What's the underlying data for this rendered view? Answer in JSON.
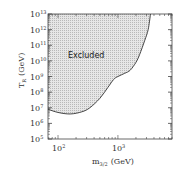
{
  "chart_data": {
    "type": "area",
    "title": "",
    "xlabel": "m_{3/2} (GeV)",
    "ylabel": "T_R (GeV)",
    "xscale": "log",
    "yscale": "log",
    "xlim": [
      68,
      8000
    ],
    "ylim": [
      100000.0,
      10000000000000.0
    ],
    "x_ticks": [
      {
        "value": 100,
        "label": "10",
        "exp": "2"
      },
      {
        "value": 1000,
        "label": "10",
        "exp": "3"
      }
    ],
    "y_ticks": [
      {
        "value": 10000000000000.0,
        "label": "10",
        "exp": "13"
      },
      {
        "value": 1000000000000.0,
        "label": "10",
        "exp": "12"
      },
      {
        "value": 100000000000.0,
        "label": "10",
        "exp": "11"
      },
      {
        "value": 10000000000.0,
        "label": "10",
        "exp": "10"
      },
      {
        "value": 1000000000.0,
        "label": "10",
        "exp": "9"
      },
      {
        "value": 100000000.0,
        "label": "10",
        "exp": "8"
      },
      {
        "value": 10000000.0,
        "label": "10",
        "exp": "7"
      },
      {
        "value": 1000000.0,
        "label": "10",
        "exp": "6"
      },
      {
        "value": 100000.0,
        "label": "10",
        "exp": "5"
      }
    ],
    "series": [
      {
        "name": "Excluded boundary",
        "x": [
          68,
          100,
          160,
          250,
          340,
          500,
          680,
          850,
          1000,
          1300,
          1600,
          2000,
          2300,
          2800,
          3200,
          3500
        ],
        "y": [
          8000000.0,
          5000000.0,
          4000000.0,
          5500000.0,
          10000000.0,
          40000000.0,
          200000000.0,
          650000000.0,
          1000000000.0,
          1600000000.0,
          2500000000.0,
          8000000000.0,
          25000000000.0,
          200000000000.0,
          1000000000000.0,
          10000000000000.0
        ]
      }
    ],
    "annotations": [
      {
        "text": "Excluded",
        "region": "above curve, shaded"
      }
    ],
    "grid": false,
    "legend": "none"
  },
  "labels": {
    "region": "Excluded",
    "x_axis_main": "m",
    "x_axis_sub": "3/2",
    "x_axis_unit": "(GeV)",
    "y_axis_main": "T",
    "y_axis_sub": "R",
    "y_axis_unit": "(GeV)"
  },
  "colors": {
    "shade": "#d4d4d4",
    "curve": "#333333",
    "frame": "#444444"
  }
}
